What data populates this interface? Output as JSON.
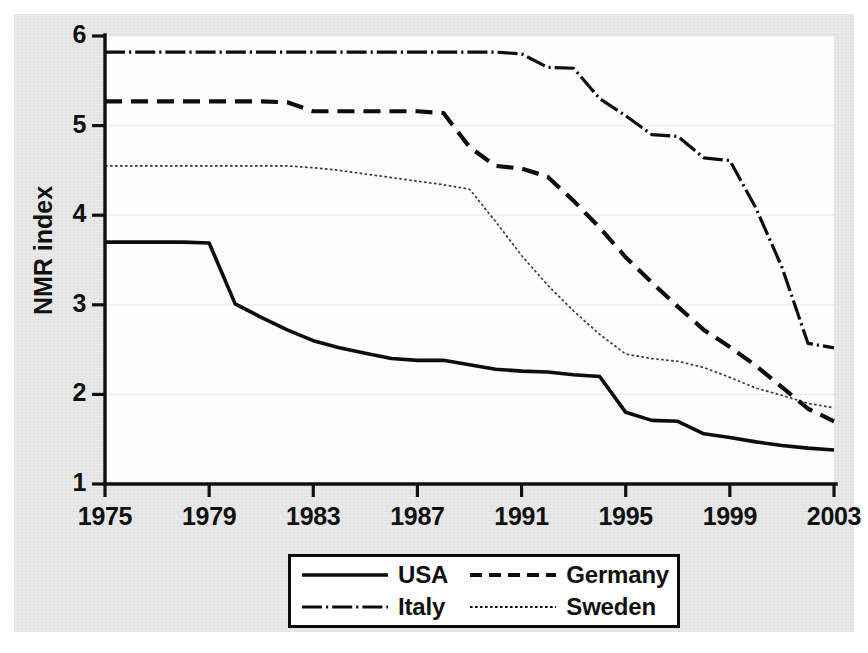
{
  "chart_data": {
    "type": "line",
    "title": "",
    "xlabel": "Year",
    "ylabel": "NMR index",
    "xlim": [
      1975,
      2003
    ],
    "ylim": [
      1,
      6
    ],
    "grid": true,
    "legend_position": "bottom",
    "xticks": [
      "1975",
      "1979",
      "1983",
      "1987",
      "1991",
      "1995",
      "1999",
      "2003"
    ],
    "xtick_values": [
      1975,
      1979,
      1983,
      1987,
      1991,
      1995,
      1999,
      2003
    ],
    "yticks": [
      "1",
      "2",
      "3",
      "4",
      "5",
      "6"
    ],
    "ytick_values": [
      1,
      2,
      3,
      4,
      5,
      6
    ],
    "x": [
      1975,
      1976,
      1977,
      1978,
      1979,
      1980,
      1981,
      1982,
      1983,
      1984,
      1985,
      1986,
      1987,
      1988,
      1989,
      1990,
      1991,
      1992,
      1993,
      1994,
      1995,
      1996,
      1997,
      1998,
      1999,
      2000,
      2001,
      2002,
      2003
    ],
    "series": [
      {
        "name": "USA",
        "style": "solid",
        "values": [
          3.7,
          3.7,
          3.7,
          3.7,
          3.69,
          3.01,
          2.86,
          2.72,
          2.6,
          2.52,
          2.46,
          2.4,
          2.38,
          2.38,
          2.33,
          2.28,
          2.26,
          2.25,
          2.22,
          2.2,
          1.8,
          1.71,
          1.7,
          1.56,
          1.52,
          1.47,
          1.43,
          1.4,
          1.38
        ]
      },
      {
        "name": "Germany",
        "style": "dashed",
        "values": [
          5.27,
          5.27,
          5.27,
          5.27,
          5.27,
          5.27,
          5.27,
          5.26,
          5.16,
          5.16,
          5.16,
          5.16,
          5.16,
          5.14,
          4.76,
          4.55,
          4.52,
          4.43,
          4.16,
          3.86,
          3.53,
          3.25,
          2.98,
          2.72,
          2.53,
          2.32,
          2.08,
          1.84,
          1.7
        ]
      },
      {
        "name": "Italy",
        "style": "dash-dot",
        "values": [
          5.82,
          5.82,
          5.82,
          5.82,
          5.82,
          5.82,
          5.82,
          5.82,
          5.82,
          5.82,
          5.82,
          5.82,
          5.82,
          5.82,
          5.82,
          5.82,
          5.8,
          5.65,
          5.64,
          5.3,
          5.11,
          4.9,
          4.88,
          4.64,
          4.61,
          4.08,
          3.42,
          2.57,
          2.52
        ]
      },
      {
        "name": "Sweden",
        "style": "dotted",
        "values": [
          4.55,
          4.55,
          4.55,
          4.55,
          4.55,
          4.55,
          4.55,
          4.55,
          4.53,
          4.5,
          4.46,
          4.42,
          4.38,
          4.34,
          4.29,
          3.93,
          3.55,
          3.22,
          2.93,
          2.67,
          2.45,
          2.4,
          2.37,
          2.3,
          2.19,
          2.07,
          1.99,
          1.9,
          1.85
        ]
      }
    ],
    "legend": [
      {
        "label": "USA",
        "style": "solid"
      },
      {
        "label": "Germany",
        "style": "dashed"
      },
      {
        "label": "Italy",
        "style": "dash-dot"
      },
      {
        "label": "Sweden",
        "style": "dotted"
      }
    ]
  },
  "colors": {
    "ink": "#0d0d0d",
    "paper": "#e9e9e9",
    "plot_background": "#fdfdfd",
    "gridline": "#ededed"
  }
}
